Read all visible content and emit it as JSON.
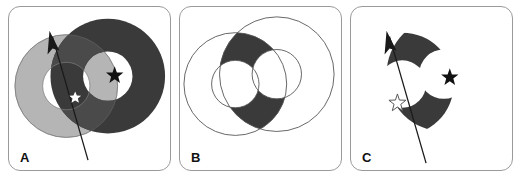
{
  "figure": {
    "type": "geometric-diagram",
    "panel_count": 3,
    "background_color": "#ffffff",
    "border_color": "#9a9a9a"
  },
  "palette": {
    "light_gray_annulus": "#b5b5b5",
    "dark_annulus": "#3a3a3a",
    "overlap_gray": "#4a4a4a",
    "intersection_fill": "#3a3a3a",
    "outline": "#555555",
    "arrow_color": "#1a1a1a",
    "star_black": "#111111",
    "star_white": "#ffffff",
    "label_color": "#111111"
  },
  "panels": [
    {
      "id": "A",
      "label": "A",
      "shapes": [
        {
          "name": "light-annulus",
          "fill": "light_gray_annulus",
          "outer_r": 52,
          "inner_r": 24,
          "cx": 58,
          "cy": 80
        },
        {
          "name": "dark-annulus",
          "fill": "dark_annulus",
          "outer_r": 58,
          "inner_r": 25,
          "cx": 100,
          "cy": 70
        },
        {
          "name": "overlap-region",
          "fill": "overlap_gray"
        }
      ],
      "markers": [
        {
          "name": "star-white",
          "symbol": "star",
          "fill": "star_white",
          "x": 67,
          "y": 91,
          "size": 7
        },
        {
          "name": "star-black",
          "symbol": "star",
          "fill": "star_black",
          "x": 107,
          "y": 68,
          "size": 9
        }
      ],
      "arrow": {
        "name": "trajectory-arrow",
        "from_x": 80,
        "from_y": 155,
        "to_x": 41,
        "to_y": 26,
        "head": "up-left"
      }
    },
    {
      "id": "B",
      "label": "B",
      "shapes": [
        {
          "name": "left-annulus-outline",
          "fill": "none",
          "outer_r": 52,
          "inner_r": 24,
          "cx": 56,
          "cy": 78
        },
        {
          "name": "right-annulus-outline",
          "fill": "none",
          "outer_r": 58,
          "inner_r": 25,
          "cx": 98,
          "cy": 68
        },
        {
          "name": "intersection-region",
          "fill": "intersection_fill"
        }
      ],
      "markers": [],
      "arrow": null
    },
    {
      "id": "C",
      "label": "C",
      "shapes": [
        {
          "name": "intersection-region",
          "fill": "intersection_fill"
        }
      ],
      "markers": [
        {
          "name": "star-outline",
          "symbol": "star",
          "fill": "star_white",
          "stroke": "outline",
          "x": 47,
          "y": 95,
          "size": 8
        },
        {
          "name": "star-black",
          "symbol": "star",
          "fill": "star_black",
          "x": 100,
          "y": 70,
          "size": 9
        }
      ],
      "arrow": {
        "name": "trajectory-arrow",
        "from_x": 76,
        "from_y": 158,
        "to_x": 36,
        "to_y": 24,
        "head": "up-left"
      }
    }
  ]
}
